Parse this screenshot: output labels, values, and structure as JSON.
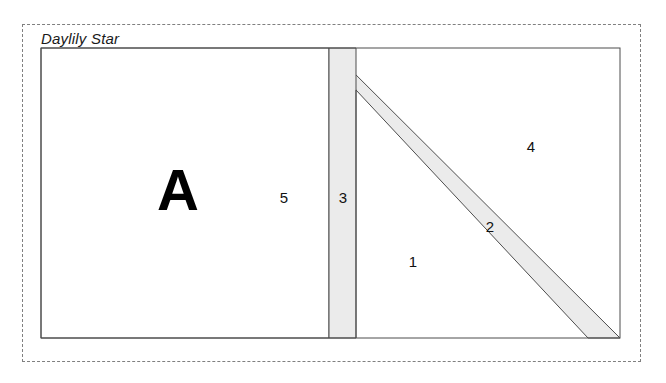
{
  "figure": {
    "caption": "Daylily Star",
    "block_letter": "A",
    "colors": {
      "outline": "#4d4d4d",
      "shaded_fill": "#ebebeb",
      "plain_fill": "#ffffff",
      "dashed_border": "#808080",
      "label_text": "#111111",
      "letter_text": "#000000"
    },
    "outer_frame": {
      "style": "dashed",
      "x": 22,
      "y": 24,
      "width": 619,
      "height": 338
    },
    "block_rect": {
      "x": 41,
      "y": 48,
      "width": 579,
      "height": 290
    },
    "regions": [
      {
        "id": "region-1",
        "label": "1",
        "shape": "triangle",
        "fill": "plain",
        "label_x": 413,
        "label_y": 261,
        "points": "356,90 356,338 588,338"
      },
      {
        "id": "region-2",
        "label": "2",
        "shape": "diagonal-band",
        "fill": "shaded",
        "label_x": 490,
        "label_y": 226,
        "points": "329,48 620,338 588,338 356,90"
      },
      {
        "id": "region-3",
        "label": "3",
        "shape": "vertical-strip",
        "fill": "shaded",
        "label_x": 343,
        "label_y": 197,
        "points": "329,48 356,48 356,338 329,338"
      },
      {
        "id": "region-4",
        "label": "4",
        "shape": "triangle",
        "fill": "plain",
        "label_x": 531,
        "label_y": 146,
        "points": "329,48 620,48 620,338"
      },
      {
        "id": "region-5",
        "label": "5",
        "shape": "rectangle",
        "fill": "plain",
        "label_x": 284,
        "label_y": 197,
        "points": "41,48 329,48 329,338 41,338"
      }
    ],
    "letter_position": {
      "x": 178,
      "y": 190
    }
  }
}
